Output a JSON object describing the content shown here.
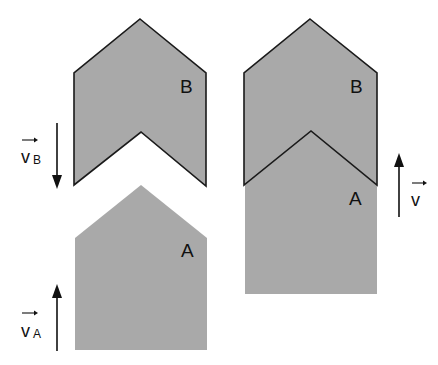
{
  "diagram": {
    "colors": {
      "fill": "#a9a9a9",
      "outline": "#1a1a1a",
      "background": "#ffffff"
    },
    "left_panel": {
      "object_b_label": "B",
      "object_a_label": "A",
      "velocity_b": {
        "symbol": "v",
        "subscript": "B",
        "direction": "down"
      },
      "velocity_a": {
        "symbol": "v",
        "subscript": "A",
        "direction": "up"
      }
    },
    "right_panel": {
      "object_b_label": "B",
      "object_a_label": "A",
      "velocity": {
        "symbol": "v",
        "subscript": "",
        "direction": "up"
      }
    }
  }
}
